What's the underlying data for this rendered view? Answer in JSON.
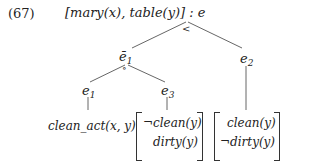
{
  "example_number": "(67)",
  "root": {
    "label": "[mary(x), table(y)] : e",
    "relation": "<"
  },
  "nodes": {
    "e_bar_1": {
      "base": "ē",
      "sub": "1",
      "relation": "∘"
    },
    "e_2": {
      "base": "e",
      "sub": "2"
    },
    "e_1": {
      "base": "e",
      "sub": "1"
    },
    "e_3": {
      "base": "e",
      "sub": "3"
    }
  },
  "leaves": {
    "e_1": "clean_act(x, y)",
    "e_3": [
      "¬clean(y)",
      "dirty(y)"
    ],
    "e_2": [
      "clean(y)",
      "¬dirty(y)"
    ]
  }
}
